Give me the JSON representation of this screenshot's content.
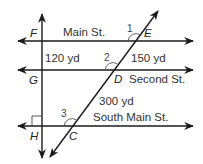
{
  "diagram": {
    "streets": {
      "main": "Main St.",
      "second": "Second St.",
      "south_main": "South Main St."
    },
    "points": {
      "F": "F",
      "E": "E",
      "G": "G",
      "D": "D",
      "H": "H",
      "C": "C"
    },
    "distances": {
      "FG": "120 yd",
      "ED": "150 yd",
      "DC": "300 yd"
    },
    "angles": {
      "a1": "1",
      "a2": "2",
      "a3": "3"
    },
    "colors": {
      "line": "#1a1a1a",
      "text": "#333333",
      "background": "#ffffff"
    }
  }
}
